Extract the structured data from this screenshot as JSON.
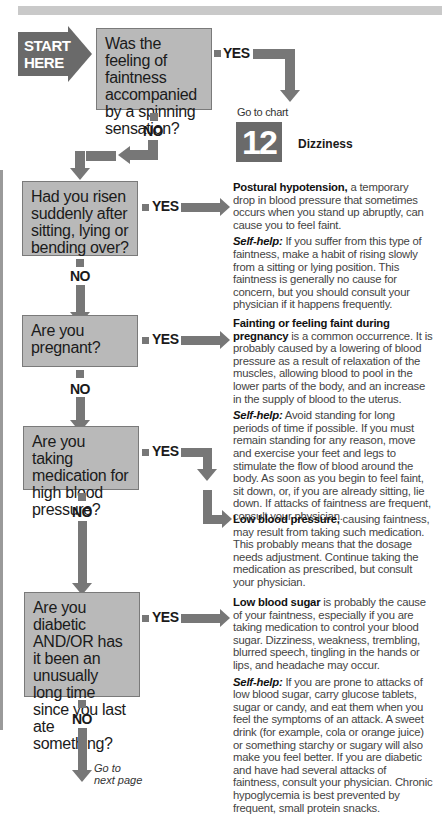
{
  "start": {
    "label_line1": "START",
    "label_line2": "HERE"
  },
  "questions": [
    {
      "id": "q1",
      "text": "Was the feeling of faintness accompanied by a spinning sensation?",
      "yes": "YES",
      "no": "NO"
    },
    {
      "id": "q2",
      "text": "Had you risen suddenly after sitting, lying or bending over?",
      "yes": "YES",
      "no": "NO"
    },
    {
      "id": "q3",
      "text": "Are you pregnant?",
      "yes": "YES",
      "no": "NO"
    },
    {
      "id": "q4",
      "text": "Are you taking medication for high blood pressure?",
      "yes": "YES",
      "no": "NO"
    },
    {
      "id": "q5",
      "text": "Are you diabetic AND/OR has it been an unusually long time since you last ate something?",
      "yes": "YES",
      "no": "NO"
    }
  ],
  "chart_ref": {
    "goto": "Go to chart",
    "number": "12",
    "label": "Dizziness"
  },
  "answers": [
    {
      "title": "Postural hypotension,",
      "body": " a temporary drop in blood pressure that sometimes occurs when you stand up abruptly, can cause you to feel faint.",
      "selfhelp_label": "Self-help:",
      "selfhelp": " If you suffer from this type of faintness, make a habit of rising slowly from a sitting or lying position. This faintness is generally no cause for concern, but you should consult your physician if it happens frequently."
    },
    {
      "title": "Fainting or feeling faint during pregnancy",
      "body": " is a common occurrence. It is probably caused by a lowering of blood pressure as a result of relaxation of the muscles, allowing blood to pool in the lower parts of the body, and an increase in the supply of blood to the uterus.",
      "selfhelp_label": "Self-help:",
      "selfhelp": " Avoid standing for long periods of time if possible. If you must remain standing for any reason, move and exercise your feet and legs to stimulate the flow of blood around the body. As soon as you begin to feel faint, sit down, or, if you are already sitting, lie down. If attacks of faintness are frequent, consult your physician."
    },
    {
      "title": "Low blood pressure,",
      "body": " causing faintness, may result from taking such medication. This probably means that the dosage needs adjustment. Continue taking the medication as prescribed, but consult your physician."
    },
    {
      "title": "Low blood sugar",
      "body": " is probably the cause of your faintness, especially if you are taking medication to control your blood sugar. Dizziness, weakness, trembling, blurred speech, tingling in the hands or lips, and headache may occur.",
      "selfhelp_label": "Self-help:",
      "selfhelp": " If you are prone to attacks of low blood sugar, carry glucose tablets, sugar or candy, and eat them when you feel the symptoms of an attack. A sweet drink (for example, cola or orange juice) or something starchy or sugary will also make you feel better. If you are diabetic and have had several attacks of faintness, consult your physician. Chronic hypoglycemia is best prevented by frequent, small protein snacks."
    }
  ],
  "footer": {
    "next_line1": "Go to",
    "next_line2": "next page"
  }
}
